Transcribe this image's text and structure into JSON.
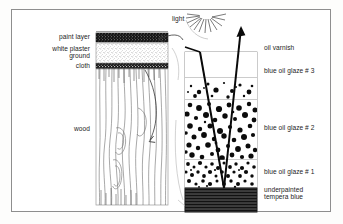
{
  "figure": {
    "border_color": "#8e8e8e",
    "background": "#ffffff"
  },
  "light": {
    "label": "light",
    "icon": "sun-rays-icon",
    "ray_color": "#111111"
  },
  "left_panel": {
    "name": "support-cross-section",
    "labels": [
      {
        "id": "paint-layer",
        "text": "paint layer"
      },
      {
        "id": "white-plaster-ground",
        "text": "white plaster\nground"
      },
      {
        "id": "cloth",
        "text": "cloth"
      },
      {
        "id": "wood",
        "text": "wood"
      }
    ],
    "layers": [
      {
        "id": "paint-layer",
        "fill": "#1a1a1a",
        "pattern": "speckle-dark"
      },
      {
        "id": "white-plaster-ground",
        "fill": "#ffffff",
        "pattern": "stipple-fine"
      },
      {
        "id": "cloth",
        "fill": "#151515",
        "pattern": "weave-dark"
      },
      {
        "id": "wood",
        "fill": "#ffffff",
        "pattern": "wood-grain"
      }
    ]
  },
  "right_panel": {
    "name": "paint-layer-detail",
    "labels": [
      {
        "id": "oil-varnish",
        "text": "oil varnish"
      },
      {
        "id": "blue-oil-glaze-3",
        "text": "blue oil glaze # 3"
      },
      {
        "id": "blue-oil-glaze-2",
        "text": "blue oil glaze # 2"
      },
      {
        "id": "blue-oil-glaze-1",
        "text": "blue oil glaze # 1"
      },
      {
        "id": "underpainted-tempera-blue",
        "text": "underpainted\ntempera blue"
      }
    ],
    "layers": [
      {
        "id": "oil-varnish",
        "fill": "#ffffff",
        "pattern": "clear",
        "pigment_density": 0
      },
      {
        "id": "blue-oil-glaze-3",
        "fill": "#ffffff",
        "pattern": "dots-sparse",
        "pigment_density": 1
      },
      {
        "id": "blue-oil-glaze-2",
        "fill": "#ffffff",
        "pattern": "dots-medium",
        "pigment_density": 2
      },
      {
        "id": "blue-oil-glaze-1",
        "fill": "#ffffff",
        "pattern": "dots-dense",
        "pigment_density": 3
      },
      {
        "id": "underpainted-tempera-blue",
        "fill": "#3a3a3a",
        "pattern": "horizontal-stripes",
        "pigment_density": 4
      }
    ]
  },
  "annotations": {
    "detail_arrow": "curved-magnify-arrow",
    "incoming_ray": "light-ray-incoming",
    "outgoing_ray": "light-ray-reflected",
    "ray_arrowhead": "arrowhead-up-icon"
  }
}
